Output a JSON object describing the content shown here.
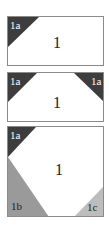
{
  "panels": [
    {
      "id": "panel-1",
      "main_label": "1",
      "corners": [
        {
          "position": "top-left",
          "label": "1a",
          "color": "#3d3d3d"
        }
      ]
    },
    {
      "id": "panel-2",
      "main_label": "1",
      "corners": [
        {
          "position": "top-left",
          "label": "1a",
          "color": "#3d3d3d"
        },
        {
          "position": "top-right",
          "label": "1a",
          "color": "#3d3d3d"
        }
      ]
    },
    {
      "id": "panel-3",
      "main_label": "1",
      "corners": [
        {
          "position": "top-left",
          "label": "1a",
          "color": "#3d3d3d"
        },
        {
          "position": "bottom-left",
          "label": "1b",
          "color": "#9a9a9a"
        },
        {
          "position": "bottom-right",
          "label": "1c",
          "color": "#bdbdbd"
        }
      ]
    }
  ],
  "colors": {
    "border": "#8a8a8a",
    "dark_corner": "#3d3d3d",
    "mid_corner": "#9a9a9a",
    "light_corner": "#bdbdbd"
  }
}
